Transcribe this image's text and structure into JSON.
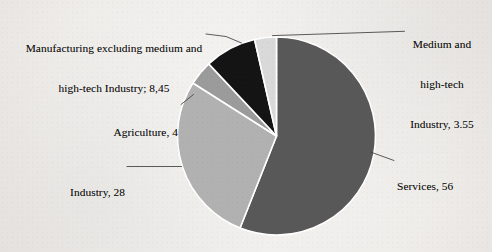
{
  "chart_data": {
    "type": "pie",
    "title": "",
    "subtitle": "",
    "xlabel": "",
    "ylabel": "",
    "legend_position": "none",
    "grid": false,
    "labels_show_value": true,
    "categories": [
      "Services",
      "Industry",
      "Agriculture",
      "Manufacturing excluding medium and high-tech Industry",
      "Medium and high-tech Industry"
    ],
    "values": [
      56,
      28,
      4,
      8.45,
      3.55
    ],
    "value_texts": [
      "56",
      "28",
      "4",
      "8,45",
      "3.55"
    ],
    "slices": [
      {
        "name": "Services",
        "value": 56,
        "value_text": "56",
        "label_text": "Services, 56",
        "color": "#585858",
        "separator": "Services, "
      },
      {
        "name": "Industry",
        "value": 28,
        "value_text": "28",
        "label_text": "Industry, 28",
        "color": "#b1b1b1",
        "separator": "Industry, "
      },
      {
        "name": "Agriculture",
        "value": 4,
        "value_text": "4",
        "label_text": "Agriculture, 4",
        "color": "#9b9b9b",
        "separator": "Agriculture, "
      },
      {
        "name": "Manufacturing excluding medium and high-tech Industry",
        "value": 8.45,
        "value_text": "8,45",
        "label_text": "Manufacturing excluding medium and high-tech Industry; 8,45",
        "color": "#141414",
        "separator": "; "
      },
      {
        "name": "Medium and high-tech Industry",
        "value": 3.55,
        "value_text": "3.55",
        "label_text": "Medium and high-tech Industry, 3.55",
        "color": "#d9d9d9",
        "separator": ", "
      }
    ],
    "total": 100.0,
    "start_angle_deg": 0,
    "direction": "clockwise",
    "slice_border_color": "#ffffff",
    "background_color": "#f3f1ef",
    "leader_line_color": "#3a3a3a"
  },
  "labels": {
    "manufacturing": {
      "line1": "Manufacturing excluding medium and",
      "line2": "high-tech Industry; 8,45"
    },
    "medium_high_tech": {
      "line1": "Medium and",
      "line2": "high-tech",
      "line3": "Industry, 3.55"
    },
    "agriculture": {
      "line1": "Agriculture, 4"
    },
    "industry": {
      "line1": "Industry, 28"
    },
    "services": {
      "line1": "Services, 56"
    }
  }
}
